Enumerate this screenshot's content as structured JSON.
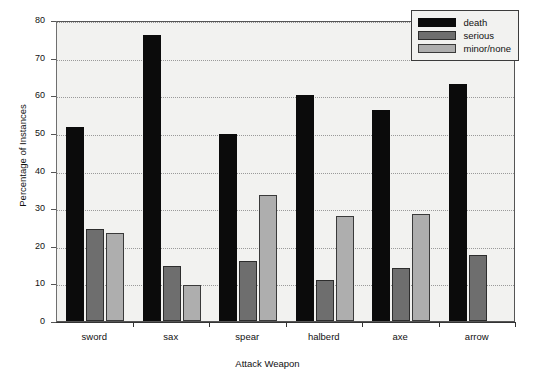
{
  "chart_data": {
    "type": "bar",
    "title": "",
    "xlabel": "Attack Weapon",
    "ylabel": "Percentage of Instances",
    "categories": [
      "sword",
      "sax",
      "spear",
      "halberd",
      "axe",
      "arrow"
    ],
    "series": [
      {
        "name": "death",
        "color": "#0b0b0b",
        "values": [
          51.5,
          76.0,
          49.7,
          60.0,
          56.0,
          63.0
        ]
      },
      {
        "name": "serious",
        "color": "#6e6e6e",
        "values": [
          24.5,
          14.5,
          16.0,
          11.0,
          14.0,
          17.5
        ]
      },
      {
        "name": "minor/none",
        "color": "#aeaeae",
        "values": [
          23.5,
          9.5,
          33.6,
          28.0,
          28.5,
          0.0
        ]
      }
    ],
    "ylim": [
      0,
      80
    ],
    "yticks": [
      0,
      10,
      20,
      30,
      40,
      50,
      60,
      70,
      80
    ],
    "ytick_labels": [
      "0",
      "10",
      "20",
      "30",
      "40",
      "50",
      "60",
      "70",
      "80"
    ],
    "grid": true,
    "grid_axis": "y",
    "legend_position": "top-right",
    "legend_entries": [
      "death",
      "serious",
      "minor/none"
    ],
    "plot_background": "#f2f2f0",
    "figure_background": "#ffffff"
  }
}
